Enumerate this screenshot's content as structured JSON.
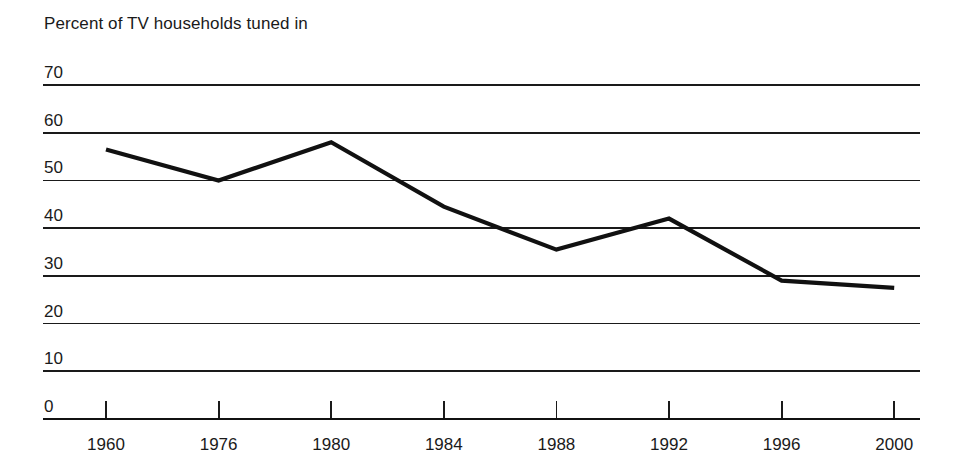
{
  "chart_data": {
    "type": "line",
    "title": "Percent of TV households tuned in",
    "xlabel": "",
    "ylabel": "",
    "categories": [
      "1960",
      "1976",
      "1980",
      "1984",
      "1988",
      "1992",
      "1996",
      "2000"
    ],
    "x": [
      1960,
      1976,
      1980,
      1984,
      1988,
      1992,
      1996,
      2000
    ],
    "values": [
      56.5,
      50,
      58,
      44.5,
      35.5,
      42,
      29,
      27.5
    ],
    "series": [
      {
        "name": "Percent of TV households tuned in",
        "values": [
          56.5,
          50,
          58,
          44.5,
          35.5,
          42,
          29,
          27.5
        ]
      }
    ],
    "ylim": [
      0,
      70
    ],
    "yticks": [
      0,
      10,
      20,
      30,
      40,
      50,
      60,
      70
    ],
    "ytick_labels": [
      "0",
      "10",
      "20",
      "30",
      "40",
      "50",
      "60",
      "70"
    ],
    "xtick_labels": [
      "1960",
      "1976",
      "1980",
      "1984",
      "1988",
      "1992",
      "1996",
      "2000"
    ],
    "grid": true,
    "grid_axis": "y",
    "legend": false,
    "legend_position": "none",
    "line_color": "#111111",
    "grid_color": "#1a1a1a",
    "background_color": "#ffffff"
  },
  "axes": {
    "y": {
      "ticks": [
        {
          "label": "70",
          "value": 70
        },
        {
          "label": "60",
          "value": 60
        },
        {
          "label": "50",
          "value": 50
        },
        {
          "label": "40",
          "value": 40
        },
        {
          "label": "30",
          "value": 30
        },
        {
          "label": "20",
          "value": 20
        },
        {
          "label": "10",
          "value": 10
        },
        {
          "label": "0",
          "value": 0
        }
      ]
    },
    "x": {
      "ticks": [
        {
          "label": "1960",
          "value": 1960
        },
        {
          "label": "1976",
          "value": 1976
        },
        {
          "label": "1980",
          "value": 1980
        },
        {
          "label": "1984",
          "value": 1984
        },
        {
          "label": "1988",
          "value": 1988
        },
        {
          "label": "1992",
          "value": 1992
        },
        {
          "label": "1996",
          "value": 1996
        },
        {
          "label": "2000",
          "value": 2000
        }
      ]
    }
  }
}
